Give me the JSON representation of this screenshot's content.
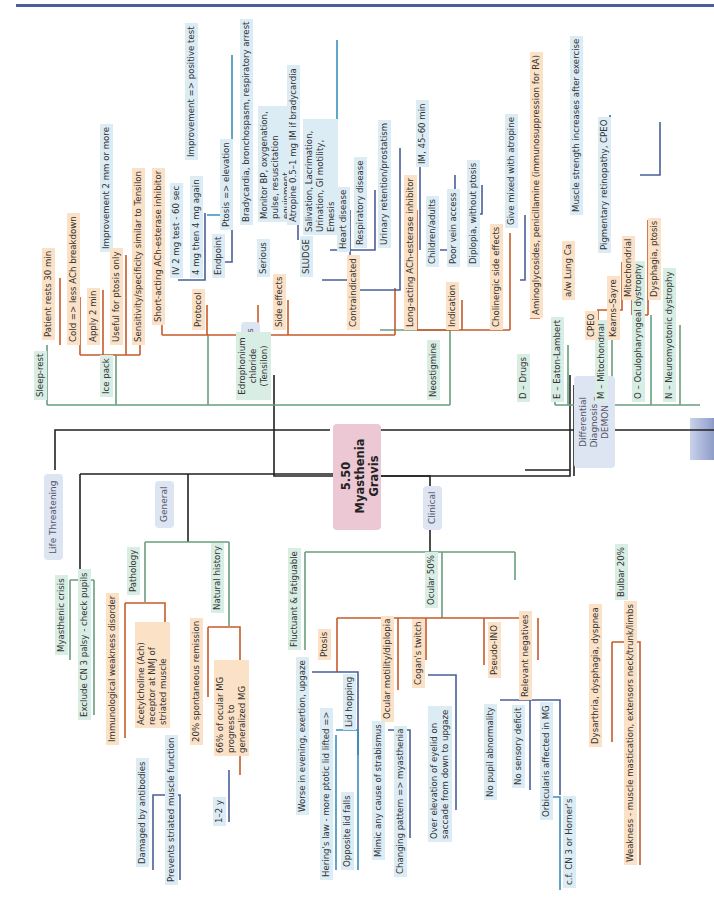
{
  "title": "5.50 Myasthenia Gravis",
  "colors": {
    "orange": "#c85a2a",
    "blue": "#4a5f9a",
    "green": "#6a9e7e",
    "black": "#222222",
    "cyan": "#3a8fbf"
  },
  "categories": {
    "diagnosis": "Diagnosis",
    "general": "General",
    "life_threatening": "Life Threatening",
    "clinical": "Clinical",
    "differential": "Differential Diagnosis – DEMON"
  },
  "diagnosis": {
    "sleep_rest": "Sleep-rest",
    "patient_rests": "Patient rests 30 min",
    "ice_pack": "Ice pack",
    "cold": "Cold => less ACh breakdown",
    "apply": "Apply 2 min",
    "improvement_2mm": "Improvement 2 mm or more",
    "useful_ptosis": "Useful for ptosis only",
    "sensitivity": "Sensitivity/specificity similar to Tensilon",
    "edrophonium": "Edrophonium chloride (Tensilon)",
    "short_acting": "Short-acting ACh-esterase inhibitor",
    "protocol": "Protocol",
    "iv_test": "IV 2 mg test - 60 sec",
    "improvement_pos": "Improvement => positive test",
    "four_mg": "4 mg then 4 mg again",
    "endpoint": "Endpoint",
    "ptosis_elev": "Ptosis => elevation",
    "side_effects": "Side effects",
    "serious": "Serious",
    "brady": "Bradycardia, bronchospasm, respiratory arrest",
    "monitor": "Monitor BP, oxygenation, pulse, resuscitation equipment",
    "atropine": "Atropine 0.5–1 mg IM if bradycardia",
    "sludge": "SLUDGE",
    "sludge_detail": "Salivation, Lacrimation, Urination, GI motility, Emesis",
    "contraindicated": "Contraindicated",
    "heart": "Heart disease",
    "respiratory": "Respiratory disease",
    "urinary": "Urinary retention/prostatism",
    "neostigmine": "Neostigmine",
    "long_acting": "Long-acting ACh-esterase inhibitor",
    "im": "IM, 45–60 min",
    "indication": "Indication",
    "children": "Children/adults",
    "poor_vein": "Poor vein access",
    "diplopia": "Diplopia, without ptosis",
    "cholinergic": "Cholinergic side effects",
    "give_atropine": "Give mixed with atropine"
  },
  "differential": {
    "drugs": "D – Drugs",
    "drugs_detail": "Aminoglycosides, penicillamine (immunosuppression for RA)",
    "eaton": "E – Eaton-Lambert",
    "lung": "a/w Lung Ca",
    "muscle_strength": "Muscle strength increases after exercise",
    "mito": "M – Mitochondrial",
    "cpeo": "CPEO",
    "kearns": "Kearns–Sayre",
    "pigmentary": "Pigmentary retinopathy, CPEO",
    "oculo": "O – Oculopharyngeal dystrophy",
    "mitochondrial": "Mitochondrial",
    "dysphagia_ptosis": "Dysphagia, ptosis",
    "neuro": "N – Neuromyotonic dystrophy"
  },
  "life": {
    "crisis": "Myasthenic crisis",
    "exclude": "Exclude CN 3 palsy - check pupils"
  },
  "general": {
    "pathology": "Pathology",
    "immuno": "Immunological weakness disorder",
    "ach": "Acetylcholine (Ach) receptor at NMJ of striated muscle",
    "damaged": "Damaged by antibodies",
    "prevents": "Prevents striated muscle function",
    "natural": "Natural history",
    "remission": "20% spontaneous remission",
    "ocular_progress": "66% of ocular MG progress to generalized MG",
    "years": "1–2 y"
  },
  "clinical": {
    "fluctuant": "Fluctuant & fatiguable",
    "ocular": "Ocular 50%",
    "ptosis": "Ptosis",
    "worse": "Worse in evening, exertion, upgaze",
    "hering": "Hering's law - more ptotic lid lifted =>",
    "opposite": "Opposite lid falls",
    "lid_hopping": "Lid hopping",
    "motility": "Ocular motility/diplopia",
    "mimic": "Mimic any cause of strabismus",
    "changing": "Changing pattern => myasthenia",
    "cogan": "Cogan's twitch",
    "over_elev": "Over elevation of eyelid on saccade from down to upgaze",
    "pseudo": "Pseudo-INO",
    "negatives": "Relevant negatives",
    "no_pupil": "No pupil abnormality",
    "no_sensory": "No sensory deficit",
    "orbicularis": "Orbicularis affected in MG",
    "cf": "c.f. CN 3 or Horner's",
    "bulbar": "Bulbar 20%",
    "dysarthria": "Dysarthria, dysphagia, dyspnea",
    "weakness": "Weakness - muscle mastication, extensors neck/trunk/limbs"
  }
}
